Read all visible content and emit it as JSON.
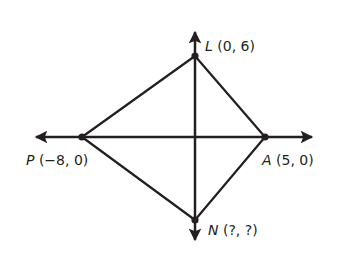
{
  "diagram": {
    "type": "coordinate-plane-quadrilateral",
    "stroke_color": "#231f20",
    "background_color": "#ffffff",
    "axes": {
      "x_axis": {
        "from": [
          30,
          137
        ],
        "to": [
          318,
          137
        ],
        "arrows": "both"
      },
      "y_axis": {
        "from": [
          195,
          26
        ],
        "to": [
          195,
          246
        ],
        "arrows": "both"
      }
    },
    "points": [
      {
        "id": "L",
        "name": "L",
        "coords": "(0, 6)",
        "px": [
          195,
          56
        ]
      },
      {
        "id": "P",
        "name": "P",
        "coords": "(−8, 0)",
        "px": [
          82,
          137
        ]
      },
      {
        "id": "A",
        "name": "A",
        "coords": "(5, 0)",
        "px": [
          265,
          137
        ]
      },
      {
        "id": "N",
        "name": "N",
        "coords": "(?, ?)",
        "px": [
          195,
          220
        ]
      }
    ],
    "segments": [
      [
        "L",
        "P"
      ],
      [
        "L",
        "A"
      ],
      [
        "P",
        "N"
      ],
      [
        "A",
        "N"
      ],
      [
        "P",
        "A"
      ],
      [
        "L",
        "N"
      ]
    ]
  },
  "labels": {
    "L": {
      "name": "L",
      "coords": "(0, 6)"
    },
    "P": {
      "name": "P",
      "coords": "(−8, 0)"
    },
    "A": {
      "name": "A",
      "coords": "(5, 0)"
    },
    "N": {
      "name": "N",
      "coords": "(?, ?)"
    }
  }
}
